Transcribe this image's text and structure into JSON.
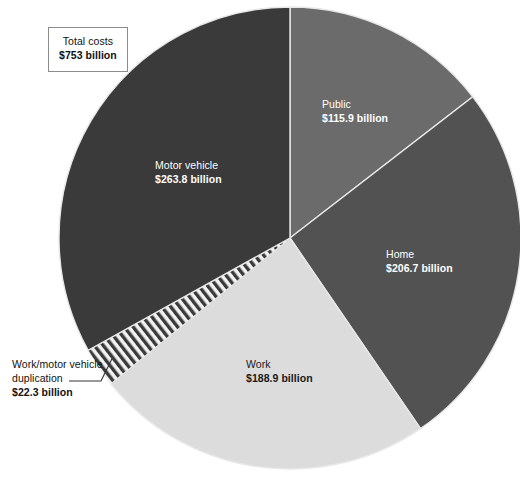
{
  "chart_data": {
    "type": "pie",
    "title": "",
    "units": "billion USD",
    "total_label": "Total costs",
    "total_value": "$753 billion",
    "total_numeric": 753,
    "start_angle_deg": 0,
    "direction": "clockwise",
    "center": {
      "x": 290,
      "y": 238
    },
    "radius": 231,
    "categories": [
      "Public",
      "Home",
      "Work",
      "Work/motor vehicle duplication",
      "Motor vehicle"
    ],
    "values": [
      115.9,
      206.7,
      188.9,
      22.3,
      263.8
    ],
    "value_labels": [
      "$115.9 billion",
      "$206.7 billion",
      "$188.9 billion",
      "$22.3 billion",
      "$263.8 billion"
    ],
    "slices": [
      {
        "name": "Public",
        "value": 115.9,
        "value_label": "$115.9 billion",
        "color": "#6b6b6b",
        "start_deg": 0,
        "end_deg": 52.3,
        "label_placement": "inside",
        "label_color": "#ffffff"
      },
      {
        "name": "Home",
        "value": 206.7,
        "value_label": "$206.7 billion",
        "color": "#525252",
        "start_deg": 52.3,
        "end_deg": 145.6,
        "label_placement": "inside",
        "label_color": "#ffffff"
      },
      {
        "name": "Work",
        "value": 188.9,
        "value_label": "$188.9 billion",
        "color": "#dcdcdc",
        "start_deg": 145.6,
        "end_deg": 230.9,
        "label_placement": "inside",
        "label_color": "#1a1a1a"
      },
      {
        "name": "Work/motor vehicle duplication",
        "value": 22.3,
        "value_label": "$22.3 billion",
        "color": "hatched",
        "pattern": "diagonal-stripes",
        "pattern_colors": [
          "#3a3a3a",
          "#f2f2f2"
        ],
        "start_deg": 230.9,
        "end_deg": 240.9,
        "label_placement": "outside-leader-line",
        "label_color": "#111111"
      },
      {
        "name": "Motor vehicle",
        "value": 263.8,
        "value_label": "$263.8 billion",
        "color": "#3a3a3a",
        "start_deg": 240.9,
        "end_deg": 360,
        "label_placement": "inside",
        "label_color": "#ffffff"
      }
    ],
    "legend": "none",
    "grid": false,
    "background_color": "#ffffff"
  },
  "total_box": {
    "label": "Total costs",
    "value": "$753 billion"
  },
  "labels": {
    "public": {
      "name": "Public",
      "value": "$115.9 billion"
    },
    "motor_vehicle": {
      "name": "Motor vehicle",
      "value": "$263.8 billion"
    },
    "home": {
      "name": "Home",
      "value": "$206.7 billion"
    },
    "work": {
      "name": "Work",
      "value": "$188.9 billion"
    },
    "duplication": {
      "name_line1": "Work/motor vehicle",
      "name_line2": "duplication",
      "value": "$22.3 billion"
    }
  },
  "colors": {
    "motor_vehicle": "#3a3a3a",
    "public": "#6b6b6b",
    "home": "#525252",
    "work": "#dcdcdc",
    "duplication_dark": "#3a3a3a",
    "duplication_light": "#f2f2f2",
    "background": "#ffffff",
    "box_border": "#8c8c8c",
    "separator": "#e8e8e8"
  }
}
